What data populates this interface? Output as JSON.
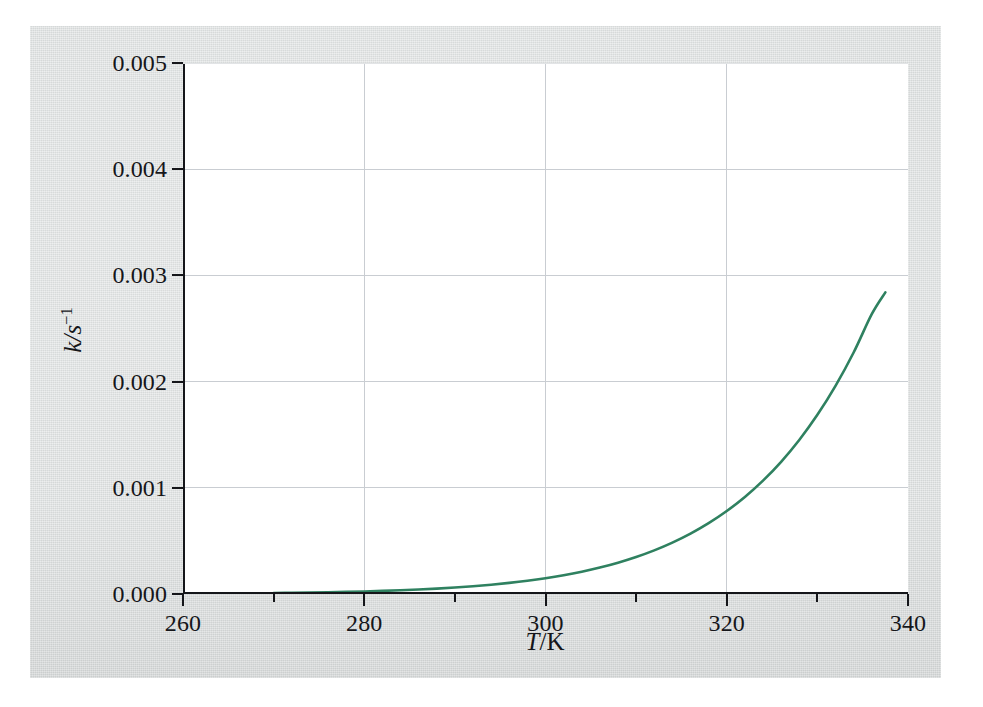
{
  "figure": {
    "background_color": "#d9dcdc",
    "plot_background_color": "#ffffff",
    "axis_color": "#15161a",
    "grid_color": "#c9cdd2"
  },
  "axis_titles": {
    "x_var": "T",
    "x_sep": "/K",
    "y_var": "k",
    "y_sep": "/s",
    "y_exp": "−1"
  },
  "chart_data": {
    "type": "line",
    "title": "",
    "subtitle": "",
    "xlabel": "T/K",
    "ylabel": "k/s⁻¹",
    "xlim": [
      260,
      340
    ],
    "ylim": [
      0.0,
      0.005
    ],
    "grid": true,
    "legend": null,
    "xticks": [
      260,
      280,
      300,
      320,
      340
    ],
    "xtick_labels": [
      "260",
      "280",
      "300",
      "320",
      "340"
    ],
    "x_minor_ticks": [
      270,
      290,
      310,
      330
    ],
    "yticks": [
      0.0,
      0.001,
      0.002,
      0.003,
      0.004,
      0.005
    ],
    "ytick_labels": [
      "0.000",
      "0.001",
      "0.002",
      "0.003",
      "0.004",
      "0.005"
    ],
    "series": [
      {
        "name": "rate constant",
        "color": "#2f8160",
        "line_width": 2.6,
        "x": [
          270,
          272,
          274,
          276,
          278,
          280,
          282,
          284,
          286,
          288,
          290,
          292,
          294,
          296,
          298,
          300,
          302,
          304,
          306,
          308,
          310,
          312,
          314,
          316,
          318,
          320,
          322,
          324,
          326,
          328,
          330,
          332,
          334,
          336,
          337.5
        ],
        "y": [
          9e-06,
          1.1e-05,
          1.34e-05,
          1.63e-05,
          1.98e-05,
          2.4e-05,
          2.9e-05,
          3.5e-05,
          4.22e-05,
          5.08e-05,
          6.1e-05,
          7.31e-05,
          8.75e-05,
          0.0001046,
          0.0001248,
          0.0001487,
          0.0001769,
          0.00021,
          0.000249,
          0.0002947,
          0.0003482,
          0.0004107,
          0.0004835,
          0.0005683,
          0.0006668,
          0.0007812,
          0.0009138,
          0.0010674,
          0.0012451,
          0.0014503,
          0.0016871,
          0.0019599,
          0.002274,
          0.0026351,
          0.00284
        ]
      }
    ]
  }
}
